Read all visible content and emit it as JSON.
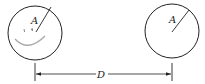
{
  "diagram": {
    "left_circle": {
      "radius_label": "A"
    },
    "right_circle": {
      "radius_label": "A"
    },
    "distance_label": "D",
    "colors": {
      "stroke": "#222222",
      "smile": "#999999",
      "background": "#ffffff"
    }
  }
}
